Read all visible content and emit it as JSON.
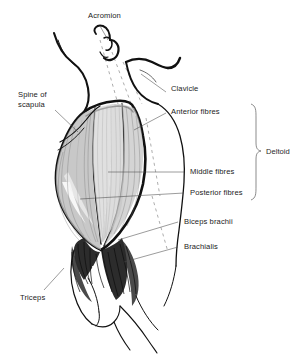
{
  "figure": {
    "background_color": "#ffffff",
    "ink_color": "#111111",
    "label_color": "#1b1b1b",
    "leader_color": "#4a4a4a"
  },
  "labels": {
    "acromion": "Acromion",
    "spine_of_scapula_line1": "Spine of",
    "spine_of_scapula_line2": "scapula",
    "clavicle": "Clavicle",
    "anterior_fibres": "Anterior fibres",
    "middle_fibres": "Middle fibres",
    "posterior_fibres": "Posterior fibres",
    "biceps_brachii": "Biceps brachii",
    "brachialis": "Brachialis",
    "triceps": "Triceps",
    "deltoid": "Deltoid"
  }
}
